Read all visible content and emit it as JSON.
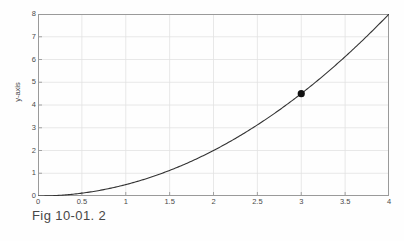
{
  "figure": {
    "caption": "Fig 10-01. 2",
    "background_color": "#fefefe"
  },
  "chart_data": {
    "type": "line",
    "title": "",
    "subtitle": "",
    "xlabel": "",
    "ylabel": "y-axis",
    "xlim": [
      0,
      4
    ],
    "ylim": [
      0,
      8
    ],
    "grid": true,
    "legend": null,
    "x_ticks": [
      0,
      0.5,
      1,
      1.5,
      2,
      2.5,
      3,
      3.5,
      4
    ],
    "x_tick_labels": [
      "0",
      "0.5",
      "1",
      "1.5",
      "2",
      "2.5",
      "3",
      "3.5",
      "4"
    ],
    "y_ticks": [
      0,
      1,
      2,
      3,
      4,
      5,
      6,
      7,
      8
    ],
    "y_tick_labels": [
      "0",
      "1",
      "2",
      "3",
      "4",
      "5",
      "6",
      "7",
      "8"
    ],
    "curve_color": "#333333",
    "grid_color": "#e2e2e2",
    "axis_color": "#9a9a9a",
    "marker_color": "#111111",
    "series": [
      {
        "name": "y = x^2 / 2",
        "x": [
          0,
          0.2,
          0.4,
          0.6,
          0.8,
          1,
          1.2,
          1.4,
          1.6,
          1.8,
          2,
          2.2,
          2.4,
          2.6,
          2.8,
          3,
          3.2,
          3.4,
          3.6,
          3.8,
          4
        ],
        "values": [
          0,
          0.02,
          0.08,
          0.18,
          0.32,
          0.5,
          0.72,
          0.98,
          1.28,
          1.62,
          2,
          2.42,
          2.88,
          3.38,
          3.92,
          4.5,
          5.12,
          5.78,
          6.48,
          7.22,
          8
        ]
      }
    ],
    "markers": [
      {
        "name": "highlighted-point",
        "x": 3,
        "y": 4.5,
        "radius": 3.6
      }
    ]
  }
}
